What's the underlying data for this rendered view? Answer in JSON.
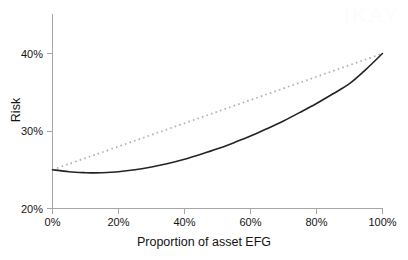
{
  "chart_data": {
    "type": "line",
    "title": "",
    "xlabel": "Proportion of asset EFG",
    "ylabel": "Risk",
    "xlim": [
      0,
      100
    ],
    "ylim": [
      20,
      45
    ],
    "grid": false,
    "legend": "none",
    "x_tick_labels": [
      "0%",
      "20%",
      "40%",
      "60%",
      "80%",
      "100%"
    ],
    "x_tick_values": [
      0,
      20,
      40,
      60,
      80,
      100
    ],
    "y_tick_labels": [
      "20%",
      "30%",
      "40%"
    ],
    "y_tick_values": [
      20,
      30,
      40
    ],
    "x": [
      0,
      5,
      10,
      12,
      15,
      20,
      25,
      30,
      35,
      40,
      45,
      50,
      55,
      60,
      65,
      70,
      75,
      80,
      85,
      90,
      95,
      100
    ],
    "series": [
      {
        "name": "Portfolio risk (with diversification)",
        "style": "solid",
        "color": "#232323",
        "values": [
          25.0,
          24.75,
          24.62,
          24.6,
          24.62,
          24.75,
          25.0,
          25.35,
          25.8,
          26.35,
          27.0,
          27.7,
          28.5,
          29.35,
          30.3,
          31.3,
          32.4,
          33.55,
          34.8,
          36.1,
          37.95,
          40.0
        ]
      },
      {
        "name": "Weighted average risk (no diversification)",
        "style": "dotted",
        "color": "#b0b0b0",
        "values": [
          25.0,
          25.75,
          26.5,
          26.8,
          27.25,
          28.0,
          28.75,
          29.5,
          30.25,
          31.0,
          31.75,
          32.5,
          33.25,
          34.0,
          34.75,
          35.5,
          36.25,
          37.0,
          37.75,
          38.5,
          39.25,
          40.0
        ]
      }
    ],
    "annotations": []
  },
  "watermark": {
    "text": "IKAY"
  }
}
